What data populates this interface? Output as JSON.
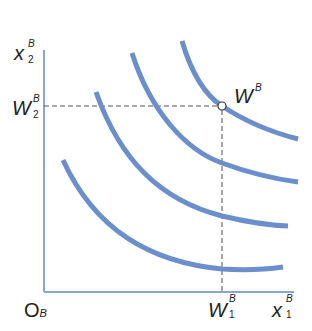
{
  "diagram": {
    "type": "indifference-curve-map",
    "origin_label": "O",
    "origin_subscript": "B",
    "y_axis": {
      "label": "x",
      "subscript": "2",
      "superscript": "B"
    },
    "x_axis": {
      "label": "x",
      "subscript": "1",
      "superscript": "B"
    },
    "endowment_point": {
      "label": "W",
      "superscript": "B"
    },
    "y_tick": {
      "label": "W",
      "subscript": "2",
      "superscript": "B"
    },
    "x_tick": {
      "label": "W",
      "subscript": "1",
      "superscript": "B"
    },
    "curve_count": 4,
    "colors": {
      "curve": "#6b8fcc",
      "axis": "#8aa6d6",
      "guide": "#555555"
    }
  }
}
